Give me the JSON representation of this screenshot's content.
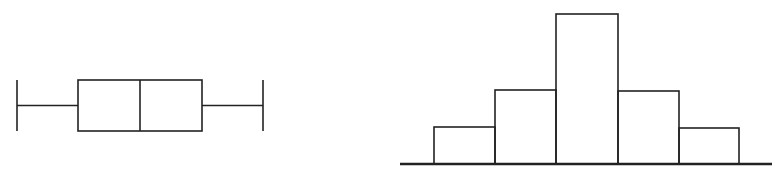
{
  "chart_data": [
    {
      "type": "box",
      "title": "",
      "xlabel": "",
      "ylabel": "",
      "orientation": "horizontal",
      "stats": {
        "min": 17,
        "q1": 78,
        "median": 140,
        "q3": 202,
        "max": 263
      },
      "note": "Values are pixel positions along the unlabeled horizontal axis; box is symmetric with median centered and equal whisker lengths",
      "grid": false,
      "legend": null
    },
    {
      "type": "bar",
      "subtype": "histogram",
      "title": "",
      "xlabel": "",
      "ylabel": "",
      "categories": [
        "bin1",
        "bin2",
        "bin3",
        "bin4",
        "bin5"
      ],
      "values": [
        1,
        2,
        4,
        2,
        1
      ],
      "note": "Relative bar heights (approx. 37, 74, 150, 73, 36 px); symmetric unimodal distribution, no axis labels",
      "grid": false,
      "legend": null
    }
  ],
  "colors": {
    "stroke": "#222222",
    "background": "#ffffff"
  },
  "geometry": {
    "box": {
      "y_top": 80,
      "y_bottom": 131,
      "y_mid": 105.5,
      "whisker_cap_top": 80,
      "whisker_cap_bottom": 131
    },
    "hist": {
      "baseline_y": 164,
      "axis_x1": 400,
      "axis_x2": 772,
      "bin_edges": [
        434,
        495,
        556,
        618,
        679,
        739
      ],
      "bar_tops": [
        127,
        90,
        14,
        91,
        128
      ]
    }
  }
}
